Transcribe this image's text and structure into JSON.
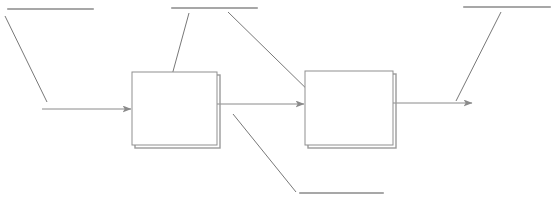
{
  "diagram": {
    "kind": "block-flow-diagram",
    "title": "",
    "canvas": {
      "width": 556,
      "height": 207,
      "background": "#ffffff"
    },
    "stroke": {
      "line_color": "#8a8a8a",
      "box_border_color": "#8f8f8f",
      "box_shadow_color": "#9a9a9a",
      "leader_color": "#787878",
      "rule_color": "#8a8a8a",
      "line_width": 1
    },
    "blocks": [
      {
        "id": "block-1",
        "label": "",
        "x": 132,
        "y": 72,
        "width": 85,
        "height": 73,
        "fill": "#ffffff"
      },
      {
        "id": "block-2",
        "label": "",
        "x": 305,
        "y": 71,
        "width": 88,
        "height": 74,
        "fill": "#ffffff"
      }
    ],
    "arrows": [
      {
        "id": "arrow-input",
        "label": "",
        "x1": 42,
        "y1": 109,
        "x2": 132,
        "y2": 109
      },
      {
        "id": "arrow-middle",
        "label": "",
        "x1": 217,
        "y1": 104,
        "x2": 305,
        "y2": 104
      },
      {
        "id": "arrow-output",
        "label": "",
        "x1": 393,
        "y1": 103,
        "x2": 473,
        "y2": 103
      }
    ],
    "callouts": [
      {
        "id": "callout-1",
        "label": "",
        "rule": {
          "x1": 8,
          "y1": 9,
          "x2": 93,
          "y2": 9
        },
        "leader": {
          "x1": 5,
          "y1": 16,
          "x2": 47,
          "y2": 102
        }
      },
      {
        "id": "callout-2",
        "label": "",
        "rule": {
          "x1": 172,
          "y1": 8,
          "x2": 257,
          "y2": 8
        },
        "leader": {
          "x1": 189,
          "y1": 13,
          "x2": 166,
          "y2": 97
        }
      },
      {
        "id": "callout-3",
        "label": "",
        "rule": null,
        "leader": {
          "x1": 228,
          "y1": 12,
          "x2": 318,
          "y2": 100
        }
      },
      {
        "id": "callout-4",
        "label": "",
        "rule": {
          "x1": 464,
          "y1": 7,
          "x2": 550,
          "y2": 7
        },
        "leader": {
          "x1": 501,
          "y1": 12,
          "x2": 456,
          "y2": 101
        }
      },
      {
        "id": "callout-5",
        "label": "",
        "rule": {
          "x1": 300,
          "y1": 193,
          "x2": 383,
          "y2": 193
        },
        "leader": {
          "x1": 233,
          "y1": 114,
          "x2": 296,
          "y2": 192
        }
      }
    ]
  }
}
